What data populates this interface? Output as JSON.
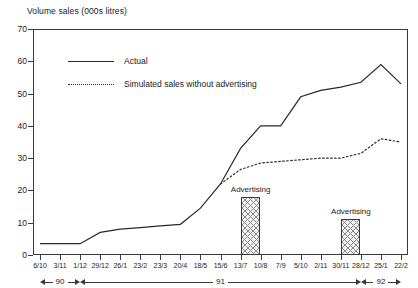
{
  "chart_data": {
    "type": "line",
    "title": "Volume sales (000s litres)",
    "xlabel": "",
    "ylabel": "Volume sales (000s litres)",
    "ylim": [
      0,
      70
    ],
    "yticks": [
      0,
      10,
      20,
      30,
      40,
      50,
      60,
      70
    ],
    "grid": false,
    "legend_position": "top-left-inside",
    "categories": [
      "6/10",
      "3/11",
      "1/12",
      "29/12",
      "26/1",
      "23/2",
      "23/3",
      "20/4",
      "18/5",
      "15/6",
      "13/7",
      "10/8",
      "7/9",
      "5/10",
      "2/11",
      "30/11",
      "28/12",
      "25/1",
      "22/2"
    ],
    "series": [
      {
        "name": "Actual",
        "style": "solid",
        "values": [
          3.5,
          3.5,
          3.5,
          7.0,
          8.0,
          8.5,
          9.0,
          9.5,
          14.5,
          22.0,
          33.0,
          40.0,
          40.0,
          49.0,
          51.0,
          52.0,
          53.5,
          59.0,
          53.0
        ]
      },
      {
        "name": "Simulated sales without advertising",
        "style": "dotted",
        "values": [
          null,
          null,
          null,
          null,
          null,
          null,
          null,
          null,
          null,
          22.0,
          26.5,
          28.5,
          29.0,
          29.5,
          30.0,
          30.0,
          31.5,
          36.0,
          35.0
        ]
      }
    ],
    "bars": [
      {
        "label": "Advertising",
        "start_category": "13/7",
        "end_category": "10/8",
        "value": 18.0
      },
      {
        "label": "Advertising",
        "start_category": "30/11",
        "end_category": "28/12",
        "value": 11.0
      }
    ],
    "year_bands": [
      {
        "label": "90",
        "start_category": "6/10",
        "end_category": "1/12"
      },
      {
        "label": "91",
        "start_category": "1/12",
        "end_category": "28/12"
      },
      {
        "label": "92",
        "start_category": "28/12",
        "end_category": "22/2"
      }
    ],
    "colors": {
      "line": "#2a2a2a",
      "axis": "#3a3a3a",
      "bar_fill": "#f2f2f2",
      "bar_hatch": "#8a8a8a",
      "background": "#ffffff"
    }
  }
}
